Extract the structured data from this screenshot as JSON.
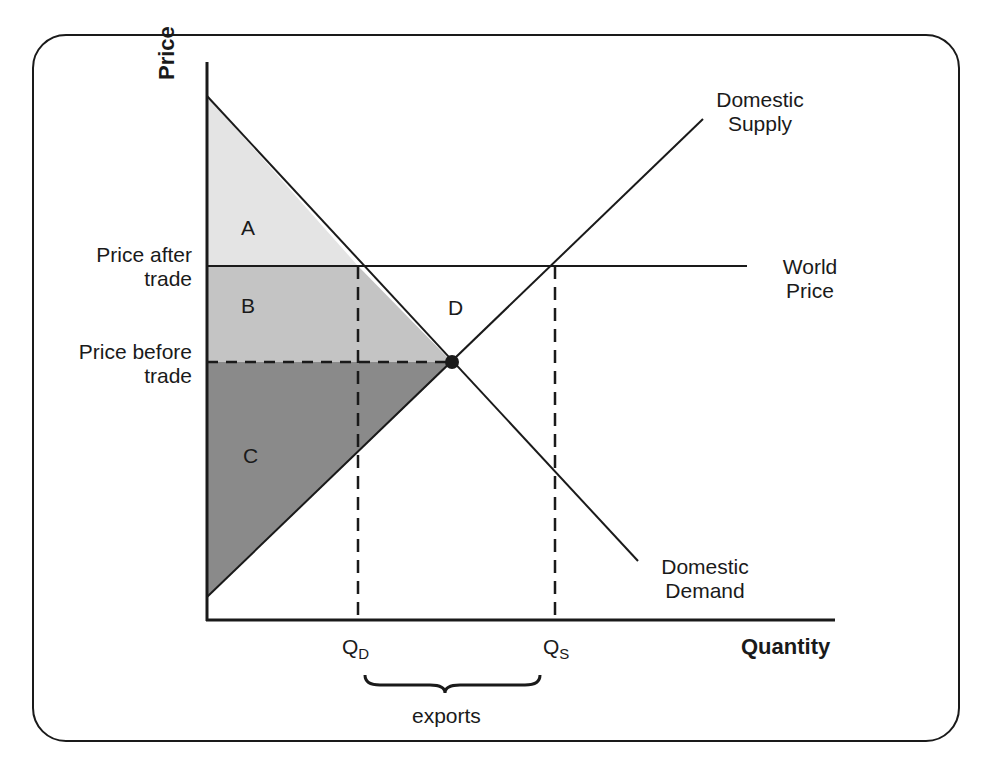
{
  "figure": {
    "axes": {
      "y_label": "Price",
      "x_label": "Quantity"
    },
    "curves": {
      "supply_label_line1": "Domestic",
      "supply_label_line2": "Supply",
      "demand_label_line1": "Domestic",
      "demand_label_line2": "Demand",
      "world_price_label_line1": "World",
      "world_price_label_line2": "Price"
    },
    "price_levels": {
      "after_line1": "Price after",
      "after_line2": "trade",
      "before_line1": "Price before",
      "before_line2": "trade"
    },
    "regions": {
      "a": "A",
      "b": "B",
      "c": "C",
      "d": "D"
    },
    "quantities": {
      "qd_main": "Q",
      "qd_sub": "D",
      "qs_main": "Q",
      "qs_sub": "S"
    },
    "brace_label": "exports",
    "colors": {
      "region_a": "#e4e4e4",
      "region_b": "#c4c4c4",
      "region_c": "#8a8a8a",
      "line": "#1a1a1a"
    }
  }
}
